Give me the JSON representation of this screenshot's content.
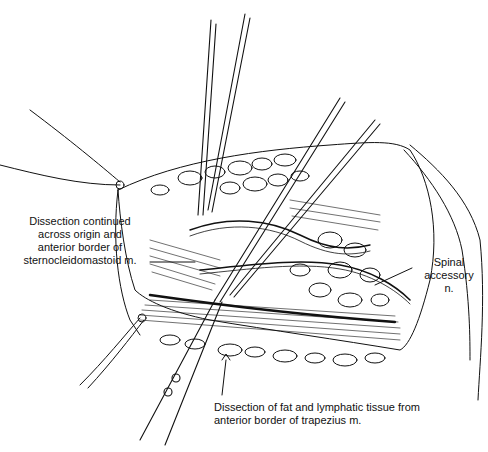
{
  "figure": {
    "type": "surgical-illustration",
    "labels": {
      "scm": {
        "lines": [
          "Dissection continued",
          "across origin and",
          "anterior border of",
          "sternocleidomastoid m."
        ]
      },
      "spinal": {
        "lines": [
          "Spinal",
          "accessory",
          "n."
        ]
      },
      "trapezius": {
        "lines": [
          "Dissection of fat and lymphatic tissue from",
          "anterior border of trapezius m."
        ]
      }
    },
    "colors": {
      "ink": "#111111",
      "background": "#ffffff"
    }
  }
}
